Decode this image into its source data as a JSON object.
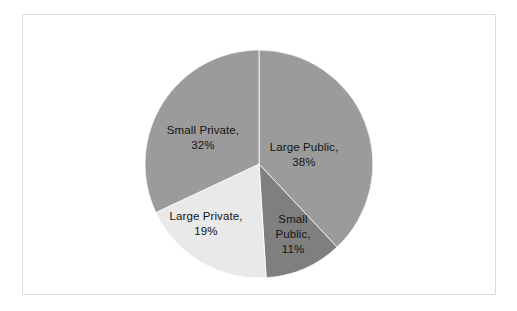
{
  "chart_data": {
    "type": "pie",
    "title": "",
    "subtitle": "",
    "xlabel": "",
    "ylabel": "",
    "grid": false,
    "legend_position": "none",
    "labels_inside_slices": true,
    "start_angle_deg": 0,
    "direction": "clockwise",
    "center": {
      "x": 259,
      "y": 164
    },
    "radius": 114,
    "categories": [
      "Large Public",
      "Small Public",
      "Large Private",
      "Small Private"
    ],
    "values": [
      38,
      11,
      19,
      32
    ],
    "value_unit": "%",
    "slices": [
      {
        "name": "Large Public",
        "label_text": "Large Public,\n38%",
        "value": 38,
        "percent": "38%",
        "color": "#9b9b9b",
        "start_deg": 0,
        "end_deg": 136.8
      },
      {
        "name": "Small Public",
        "label_text": "Small\nPublic,\n11%",
        "value": 11,
        "percent": "11%",
        "color": "#7f7f7f",
        "start_deg": 136.8,
        "end_deg": 176.4
      },
      {
        "name": "Large Private",
        "label_text": "Large Private,\n19%",
        "value": 19,
        "percent": "19%",
        "color": "#e9e9e9",
        "start_deg": 176.4,
        "end_deg": 244.8
      },
      {
        "name": "Small Private",
        "label_text": "Small Private,\n32%",
        "value": 32,
        "percent": "32%",
        "color": "#9b9b9b",
        "start_deg": 244.8,
        "end_deg": 360
      }
    ]
  },
  "frame": {
    "border_color": "#dcdcdc",
    "background_color": "#ffffff"
  }
}
